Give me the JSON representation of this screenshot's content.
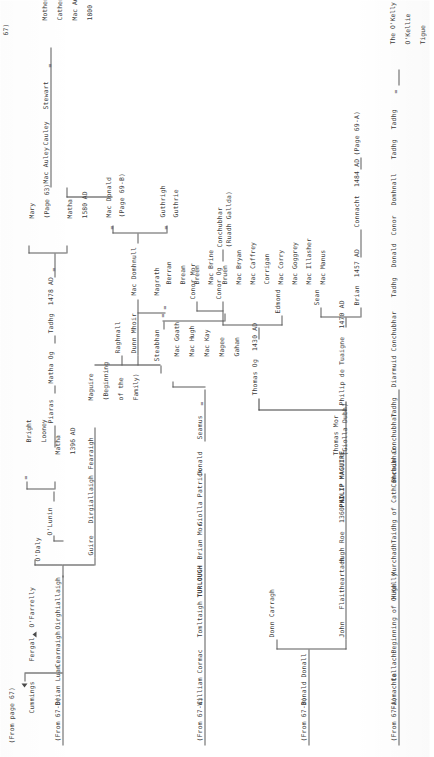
{
  "page": {
    "header": "(From page 67)",
    "title_note": "67)"
  },
  "columns": {
    "a": {
      "source": "(From 67-A)",
      "lineage": [
        "Fiomachta",
        "Cellach",
        "Beginning of O'Kelly",
        "Hugh",
        "Murchadh",
        "Taidhg of Cath Bhrain",
        "Conchubhar",
        "Conchubhar",
        "Tadhg",
        "Diarmuid",
        "Conchubhar",
        "Tadhg",
        "Donald",
        "Conor",
        "Domhnall",
        "Tadhg",
        "Tadhg"
      ],
      "marriage_symbol": "=",
      "terminal": [
        "The O'Kelly",
        "O'Kellie",
        "Tigue"
      ]
    },
    "b": {
      "source": "(From 67-B)",
      "lineage": [
        "Donald",
        "Donall"
      ],
      "branch_right": "Donn Carragh",
      "branch_left": [
        "John",
        "Flaitheartach",
        "Hugh Roe  1360 AD",
        "PHILIP MAGUIRE",
        "Thomas Mor",
        "(Giolla Dubh)"
      ],
      "philip": "Philip de Tuaigne  1470 AD",
      "children_lower": [
        "Brian  1457 AD",
        "Sean"
      ],
      "brian_line": [
        "Connacht  1484 AD",
        "(Page 69-A)"
      ],
      "thomas_og": "Thomas Og  1430 AD",
      "thomas_children": [
        "Conor Mor",
        "Conor Og",
        "Conchubhar",
        "(Ruadh Gallda)"
      ],
      "edmond": "Edmond"
    },
    "c": {
      "source": "(From 67-C)",
      "lineage": [
        "William",
        "Cormac",
        "Tomltaigh",
        "TURLOUGH",
        "Brian Mor",
        "Giolla Patrick",
        "Donald",
        "Seamus"
      ],
      "marriage_symbol": "=",
      "descendant_names": [
        "Mac Goath",
        "Mac Hugh",
        "Mac Kay",
        "Magee",
        "Gahan"
      ]
    },
    "d": {
      "source": "(From 67-D)",
      "lineage": [
        "Brian Luan",
        "Cearnaigh",
        "Oirghiallaigh"
      ],
      "odaly": "O'Daly",
      "fergal": "Fergal",
      "ofarrelly": "O'Farrelly",
      "cummings": "Cummings",
      "guire": "Guire",
      "dirgiallaigh": "Dirgiallaigh",
      "fearaigh": "Fearaigh",
      "maguire": [
        "Maguire",
        "(Beginning",
        "of the",
        "Family)"
      ],
      "olunin": "O'Lunin",
      "bright_looney": [
        "Bright",
        "Looney"
      ],
      "matha1396": [
        "Matha",
        "1396 AD"
      ],
      "piaras": "Piaras",
      "matha_og": "Matha Og",
      "tadhg1478": "Tadhg  1478 AD",
      "matha1580": [
        "Matha",
        "1580 AD"
      ],
      "mary": [
        "Mary",
        "(Page 63)"
      ],
      "steabhan": "Steabhan",
      "raghnall": "Raghnall",
      "dunn_mhoir": "Dunn Mhoir",
      "magrath": "Magrath",
      "mac_domhnull": "Mac Domhnull",
      "guthrigh": "Guthrigh",
      "guthrie": "Guthrie",
      "mac_donald": "Mac Donald",
      "page69b": "(Page 69-B)",
      "mac_auley": "Mac Auley",
      "cauley": "Cauley",
      "stewart": "Stewart",
      "mother": [
        "Mother",
        "Catherine",
        "Mac Auley",
        "1800"
      ],
      "surnames": [
        "Berran",
        "Brean",
        "Breen",
        "Mac Brine",
        "Bruen",
        "Mac Bryan",
        "Mac Caffrey",
        "Corrigan",
        "Mac Corry",
        "Mac Goggrey",
        "Mac Illasher",
        "Mac Manus"
      ]
    }
  },
  "symbols": {
    "equals": "=",
    "dash": "-"
  },
  "colors": {
    "ink": "#3a3a3a",
    "rule": "#5a5a5a",
    "paper": "#ffffff"
  }
}
